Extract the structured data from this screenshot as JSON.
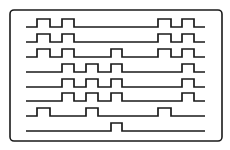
{
  "diagram": {
    "type": "timing-waveform",
    "frame": {
      "x": 10,
      "y": 10,
      "width": 212,
      "height": 131,
      "radius": 4
    },
    "line_start_x": 26,
    "line_end_x": 205,
    "pulse_height": 8,
    "colors": {
      "stroke": "#1a1a1a",
      "background": "#ffffff"
    },
    "rows": [
      {
        "baseline_y": 27,
        "pulses": [
          [
            37,
            50
          ],
          [
            62,
            74
          ],
          [
            158,
            171
          ],
          [
            182,
            194
          ]
        ]
      },
      {
        "baseline_y": 42,
        "pulses": [
          [
            37,
            50
          ],
          [
            62,
            74
          ],
          [
            158,
            171
          ],
          [
            182,
            194
          ]
        ]
      },
      {
        "baseline_y": 57,
        "pulses": [
          [
            37,
            50
          ],
          [
            62,
            74
          ],
          [
            111,
            122
          ],
          [
            158,
            171
          ],
          [
            182,
            194
          ]
        ]
      },
      {
        "baseline_y": 72,
        "pulses": [
          [
            62,
            74
          ],
          [
            86,
            98
          ],
          [
            111,
            122
          ],
          [
            182,
            194
          ]
        ]
      },
      {
        "baseline_y": 87,
        "pulses": [
          [
            62,
            74
          ],
          [
            86,
            98
          ],
          [
            111,
            122
          ],
          [
            182,
            194
          ]
        ]
      },
      {
        "baseline_y": 101,
        "pulses": [
          [
            62,
            74
          ],
          [
            86,
            98
          ],
          [
            111,
            122
          ],
          [
            182,
            194
          ]
        ]
      },
      {
        "baseline_y": 116,
        "pulses": [
          [
            37,
            50
          ],
          [
            86,
            98
          ],
          [
            158,
            171
          ]
        ]
      },
      {
        "baseline_y": 131,
        "pulses": [
          [
            111,
            122
          ]
        ]
      }
    ]
  }
}
